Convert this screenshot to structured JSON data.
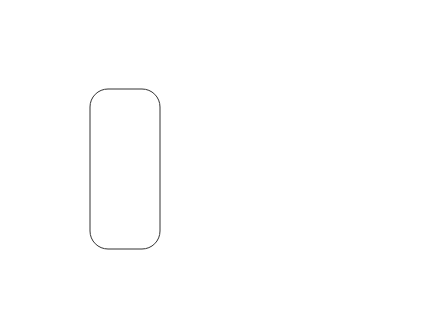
{
  "diagram": {
    "nodes": {
      "peripheral_adipose": [
        "Peripheral",
        "adipose",
        "tissue"
      ],
      "tnfa": "TNFα",
      "lipogenesis": "Lipogenesis",
      "ffa_outer": "FFA",
      "ffa_inner": "FFA",
      "beta_oxidation": "β-Oxidation",
      "ketones": "Ketones",
      "lipid_droplets": [
        "Lipid",
        "droplets"
      ],
      "tg": "TG",
      "ros_rns": "ROS/RNS",
      "o2_top": "O2",
      "o2_bottom": "O2",
      "o2_bottom_sup": "−",
      "other_cytokines": [
        "Other cytokines",
        "(IL-1, IL-6)"
      ],
      "hepatocyte": "Hepatocyte",
      "lipoproteins": "Lipoproteins"
    },
    "edge_labels": {
      "tnf_to_adipose": "(+)",
      "tnf_to_lipogenesis": "(+)",
      "tnf_to_beta_ox": "(−)",
      "tnf_to_o2": "(+)",
      "cytokines_to_tg": "(−)"
    }
  }
}
